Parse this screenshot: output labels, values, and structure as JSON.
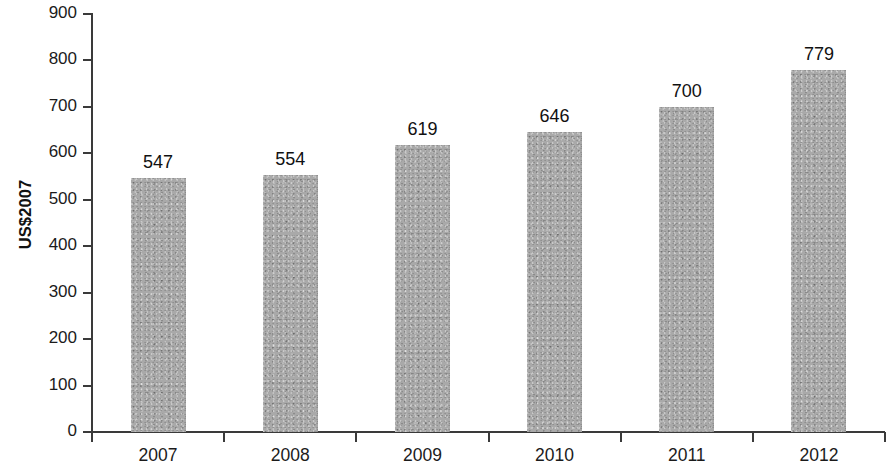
{
  "chart_data": {
    "type": "bar",
    "title": "",
    "subtitle": "",
    "xlabel": "",
    "ylabel": "US$2007",
    "categories": [
      "2007",
      "2008",
      "2009",
      "2010",
      "2011",
      "2012"
    ],
    "values": [
      547,
      554,
      619,
      646,
      700,
      779
    ],
    "value_labels": [
      "547",
      "554",
      "619",
      "646",
      "700",
      "779"
    ],
    "ylim": [
      0,
      900
    ],
    "ytick_labels": [
      "0",
      "100",
      "200",
      "300",
      "400",
      "500",
      "600",
      "700",
      "800",
      "900"
    ],
    "ytick_values": [
      0,
      100,
      200,
      300,
      400,
      500,
      600,
      700,
      800,
      900
    ],
    "grid": false,
    "legend": null,
    "legend_position": "none",
    "bar_color": "#a9a9a9",
    "axis_color": "#3a3a3a",
    "text_color": "#1b1b1b",
    "background_color": "#ffffff"
  }
}
